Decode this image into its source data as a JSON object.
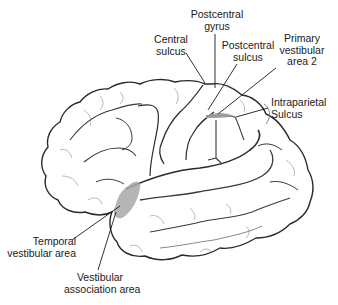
{
  "figure": {
    "colors": {
      "outline": "#2a2a2a",
      "sulcus": "#3a3a3a",
      "fine_detail": "#8a8a8a",
      "shaded_area": "#9a9a9a",
      "leader_line": "#1a1a1a",
      "text": "#1a1a1a",
      "background": "#ffffff"
    }
  },
  "labels": {
    "postcentral_gyrus": "Postcentral\ngyrus",
    "central_sulcus": "Central\nsulcus",
    "postcentral_sulcus": "Postcentral\nsulcus",
    "primary_vestibular_area_2": "Primary\nvestibular\narea 2",
    "intraparietal_sulcus": "Intraparietal\nSulcus",
    "temporal_vestibular_area": "Temporal\nvestibular area",
    "vestibular_association_area": "Vestibular\nassociation area"
  }
}
